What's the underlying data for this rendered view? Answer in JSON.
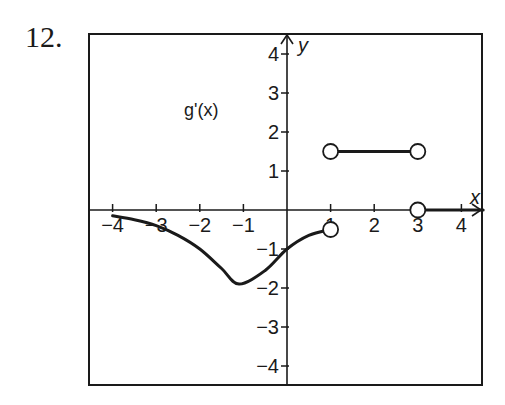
{
  "problem": {
    "number": "12."
  },
  "chart_data": {
    "type": "line",
    "title": "",
    "function_label": "g'(x)",
    "xlabel": "x",
    "ylabel": "y",
    "xlim": [
      -4.5,
      4.5
    ],
    "ylim": [
      -4.5,
      4.5
    ],
    "x_ticks": [
      -4,
      -3,
      -2,
      -1,
      1,
      2,
      3,
      4
    ],
    "y_ticks": [
      -4,
      -3,
      -2,
      -1,
      1,
      2,
      3,
      4
    ],
    "x_tick_labels": [
      "−4",
      "−3",
      "−2",
      "−1",
      "1",
      "2",
      "3",
      "4"
    ],
    "y_tick_labels": [
      "4",
      "3",
      "2",
      "1",
      "−1",
      "−2",
      "−3",
      "−4"
    ],
    "grid": false,
    "series": [
      {
        "name": "curve",
        "x": [
          -4,
          -3.5,
          -3,
          -2.5,
          -2,
          -1.5,
          -1.1,
          -0.5,
          0,
          0.5,
          1
        ],
        "y": [
          -0.15,
          -0.25,
          -0.4,
          -0.65,
          -1.0,
          -1.5,
          -1.9,
          -1.55,
          -1.0,
          -0.65,
          -0.5
        ],
        "end_open": true
      },
      {
        "name": "constant-segment",
        "x": [
          1,
          3
        ],
        "y": [
          1.5,
          1.5
        ],
        "start_open": true,
        "end_open": true
      },
      {
        "name": "zero-segment",
        "x": [
          3,
          4.5
        ],
        "y": [
          0,
          0
        ],
        "start_open": true
      }
    ],
    "open_points": [
      {
        "x": 1,
        "y": -0.5
      },
      {
        "x": 1,
        "y": 1.5
      },
      {
        "x": 3,
        "y": 1.5
      },
      {
        "x": 3,
        "y": 0
      }
    ]
  }
}
